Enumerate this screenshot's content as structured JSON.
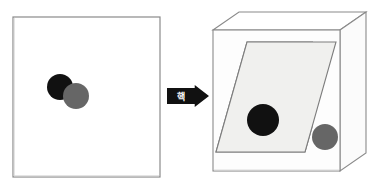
{
  "figure": {
    "title": "",
    "background_color": "#ffffff",
    "width": 377,
    "height": 186
  },
  "colors": {
    "outline": "#8a8a8a",
    "outline_dark": "#6e6e6e",
    "panel_fill": "#ffffff",
    "plane_fill": "#f0f0ee",
    "box_front_fill": "#fdfdfd",
    "box_top_fill": "#ffffff",
    "box_side_fill": "#fbfbfb",
    "dark_circle": "#111111",
    "gray_circle": "#666666",
    "arrow_fill": "#111111",
    "arrow_text": "#ffffff"
  },
  "left_panel": {
    "name": "flat-square-panel",
    "shape": "square",
    "x": 13,
    "y": 17,
    "width": 147,
    "height": 160,
    "circles": [
      {
        "name": "dark-circle",
        "color": "#111111",
        "cx": 60,
        "cy": 87,
        "r": 13
      },
      {
        "name": "gray-circle",
        "color": "#666666",
        "cx": 76,
        "cy": 96,
        "r": 13
      }
    ]
  },
  "arrow": {
    "name": "transition-arrow",
    "label": "핵",
    "fill": "#111111",
    "text_color": "#ffffff",
    "x": 167,
    "y": 85,
    "width": 42,
    "height": 22
  },
  "right_panel": {
    "name": "three-d-box",
    "shape": "cube",
    "front": {
      "x": 213,
      "y": 30,
      "width": 127,
      "height": 141
    },
    "depth_x": 26,
    "depth_y": 18,
    "plane": {
      "name": "tilted-plane",
      "fill": "#f0f0ee",
      "points": "247,42 336,42 305,152 216,152"
    },
    "circles": [
      {
        "name": "dark-circle",
        "color": "#111111",
        "cx": 263,
        "cy": 120,
        "r": 16
      },
      {
        "name": "gray-circle",
        "color": "#666666",
        "cx": 325,
        "cy": 137,
        "r": 13
      }
    ]
  }
}
